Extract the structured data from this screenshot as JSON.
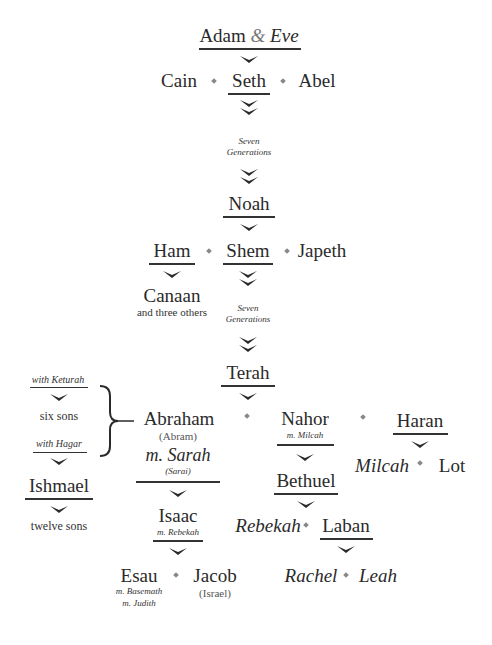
{
  "nodes": {
    "adam": "Adam",
    "amp": "&",
    "eve": "Eve",
    "cain": "Cain",
    "seth": "Seth",
    "abel": "Abel",
    "seven_gen_1a": "Seven",
    "seven_gen_1b": "Generations",
    "noah": "Noah",
    "ham": "Ham",
    "shem": "Shem",
    "japeth": "Japeth",
    "canaan": "Canaan",
    "canaan_note": "and three others",
    "seven_gen_2a": "Seven",
    "seven_gen_2b": "Generations",
    "terah": "Terah",
    "with_keturah": "with Keturah",
    "six_sons": "six sons",
    "with_hagar": "with Hagar",
    "ishmael": "Ishmael",
    "twelve_sons": "twelve sons",
    "abraham": "Abraham",
    "abram": "(Abram)",
    "m_sarah": "m. Sarah",
    "sarai": "(Sarai)",
    "nahor": "Nahor",
    "m_milcah": "m. Milcah",
    "haran": "Haran",
    "milcah": "Milcah",
    "lot": "Lot",
    "bethuel": "Bethuel",
    "rebekah": "Rebekah",
    "laban": "Laban",
    "isaac": "Isaac",
    "m_rebekah": "m. Rebekah",
    "esau": "Esau",
    "m_basemath": "m. Basemath",
    "m_judith": "m. Judith",
    "jacob": "Jacob",
    "israel": "(Israel)",
    "rachel": "Rachel",
    "leah": "Leah"
  },
  "colors": {
    "text": "#2a2a2a",
    "separator": "#888888",
    "line": "#333333"
  }
}
